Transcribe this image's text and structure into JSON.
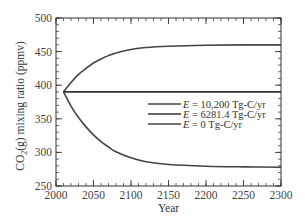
{
  "chart_data": {
    "type": "line",
    "title": "",
    "xlabel": "Year",
    "ylabel": "CO2(g) mixing ratio (ppmv)",
    "ylabel_parts": {
      "pre": "CO",
      "sub": "2",
      "post": "(g) mixing ratio (ppmv)"
    },
    "xlim": [
      2000,
      2300
    ],
    "ylim": [
      250,
      500
    ],
    "xticks": [
      2000,
      2050,
      2100,
      2150,
      2200,
      2250,
      2300
    ],
    "yticks": [
      250,
      300,
      350,
      400,
      450,
      500
    ],
    "x_minor_step": 10,
    "y_minor_step": 10,
    "grid": false,
    "legend_position": "center-right",
    "series": [
      {
        "name": "E = 10,200 Tg-C/yr",
        "legend_var": "E",
        "legend_rest": " = 10,200 Tg-C/yr",
        "color": "#444444",
        "x": [
          2010,
          2020,
          2030,
          2040,
          2050,
          2060,
          2070,
          2080,
          2100,
          2120,
          2150,
          2200,
          2250,
          2300
        ],
        "y": [
          390,
          404,
          416,
          425,
          433,
          439,
          444,
          448,
          453,
          456,
          458,
          459.5,
          460,
          460
        ]
      },
      {
        "name": "E = 6281.4 Tg-C/yr",
        "legend_var": "E",
        "legend_rest": " = 6281.4 Tg-C/yr",
        "color": "#333333",
        "x": [
          2010,
          2300
        ],
        "y": [
          390,
          390
        ]
      },
      {
        "name": "E = 0 Tg-C/yr",
        "legend_var": "E",
        "legend_rest": " = 0 Tg-C/yr",
        "color": "#444444",
        "x": [
          2010,
          2020,
          2030,
          2040,
          2050,
          2060,
          2070,
          2080,
          2100,
          2120,
          2150,
          2200,
          2250,
          2300
        ],
        "y": [
          390,
          369,
          352,
          338,
          326,
          316,
          308,
          301,
          292,
          286,
          282,
          279.5,
          278.5,
          278
        ]
      }
    ]
  }
}
